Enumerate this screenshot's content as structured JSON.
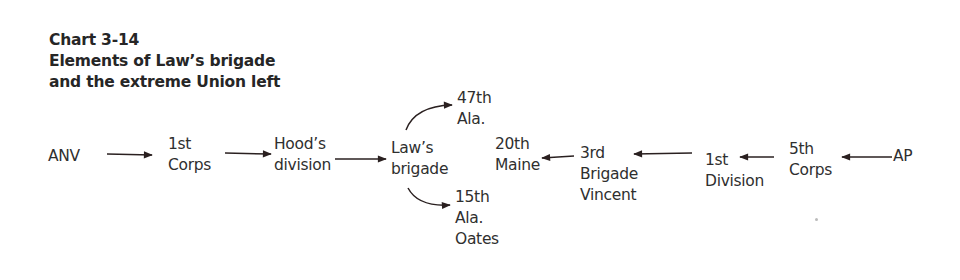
{
  "title": {
    "line1": "Chart 3-14",
    "line2": "Elements of Law’s brigade",
    "line3": "and the extreme Union left"
  },
  "nodes": {
    "anv": [
      "ANV"
    ],
    "first_corps": [
      "1st",
      "Corps"
    ],
    "hoods_division": [
      "Hood’s",
      "division"
    ],
    "laws_brigade": [
      "Law’s",
      "brigade"
    ],
    "ala_47": [
      "47th",
      "Ala."
    ],
    "ala_15": [
      "15th",
      "Ala.",
      "Oates"
    ],
    "maine_20": [
      "20th",
      "Maine"
    ],
    "third_brigade": [
      "3rd",
      "Brigade",
      "Vincent"
    ],
    "first_division": [
      "1st",
      "Division"
    ],
    "fifth_corps": [
      "5th",
      "Corps"
    ],
    "ap": [
      "AP"
    ]
  },
  "edges": [
    {
      "from": "ANV",
      "to": "1st Corps"
    },
    {
      "from": "1st Corps",
      "to": "Hood’s division"
    },
    {
      "from": "Hood’s division",
      "to": "Law’s brigade"
    },
    {
      "from": "Law’s brigade",
      "to": "47th Ala."
    },
    {
      "from": "Law’s brigade",
      "to": "15th Ala. Oates"
    },
    {
      "from": "AP",
      "to": "5th Corps"
    },
    {
      "from": "5th Corps",
      "to": "1st Division"
    },
    {
      "from": "1st Division",
      "to": "3rd Brigade Vincent"
    },
    {
      "from": "3rd Brigade Vincent",
      "to": "20th Maine"
    }
  ]
}
